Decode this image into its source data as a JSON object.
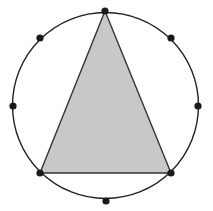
{
  "diagram": {
    "type": "inscribed-triangle-in-circle",
    "circle": {
      "cx": 105.5,
      "cy": 105.5,
      "r": 93,
      "stroke": "#222222"
    },
    "points": [
      {
        "id": "top",
        "x": 105,
        "y": 11
      },
      {
        "id": "upper-right",
        "x": 171,
        "y": 38
      },
      {
        "id": "right",
        "x": 198,
        "y": 106
      },
      {
        "id": "lower-right",
        "x": 171,
        "y": 173
      },
      {
        "id": "bottom",
        "x": 106,
        "y": 201
      },
      {
        "id": "lower-left",
        "x": 40,
        "y": 173
      },
      {
        "id": "left",
        "x": 13,
        "y": 106
      },
      {
        "id": "upper-left",
        "x": 40,
        "y": 38
      }
    ],
    "triangle": {
      "vertices": [
        "top",
        "lower-left",
        "lower-right"
      ],
      "fill": "#c8c8c8",
      "stroke": "#333333"
    },
    "point_color": "#1a1a1a"
  }
}
